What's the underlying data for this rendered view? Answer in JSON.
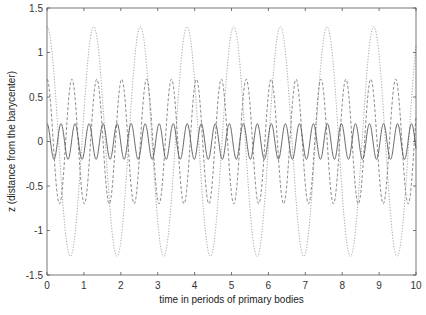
{
  "chart_data": {
    "type": "line",
    "title": "",
    "xlabel": "time in periods of primary bodies",
    "ylabel": "z (distance from the barycenter)",
    "xlim": [
      0,
      10
    ],
    "ylim": [
      -1.5,
      1.5
    ],
    "xticks": [
      0,
      1,
      2,
      3,
      4,
      5,
      6,
      7,
      8,
      9,
      10
    ],
    "xtick_labels": [
      "0",
      "1",
      "2",
      "3",
      "4",
      "5",
      "6",
      "7",
      "8",
      "9",
      "10"
    ],
    "yticks": [
      -1.5,
      -1,
      -0.5,
      0,
      0.5,
      1,
      1.5
    ],
    "ytick_labels": [
      "-1.5",
      "-1",
      "-0.5",
      "0",
      "0.5",
      "1",
      "1.5"
    ],
    "grid": false,
    "legend": null,
    "series": [
      {
        "name": "large-amplitude orbit",
        "style": "dotted",
        "color": "#9a9a9a",
        "function": "amplitude*cos(2*pi*t/period)",
        "amplitude": 1.29,
        "period": 1.265,
        "peaks_t": [
          0,
          1.27,
          2.53,
          3.8,
          5.06,
          6.33,
          7.59,
          8.86
        ]
      },
      {
        "name": "medium-amplitude orbit",
        "style": "dashed",
        "color": "#7a7a7a",
        "function": "amplitude*cos(2*pi*t/period)",
        "amplitude": 0.7,
        "period": 0.675
      },
      {
        "name": "small-amplitude orbit",
        "style": "solid",
        "color": "#555555",
        "function": "amplitude*cos(2*pi*t/period)",
        "amplitude": 0.2,
        "period": 0.38
      }
    ]
  },
  "layout": {
    "plot_left": 47,
    "plot_right": 416,
    "plot_top": 8,
    "plot_bottom": 275
  }
}
